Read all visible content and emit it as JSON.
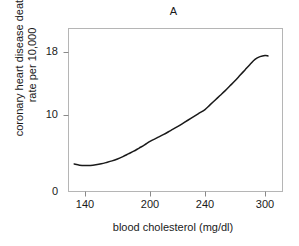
{
  "chart_data": {
    "type": "line",
    "title": "A",
    "xlabel": "blood cholesterol (mg/dl)",
    "ylabel_line1": "coronary heart disease death",
    "ylabel_line2": "rate per 10,000",
    "ylabel": "coronary heart disease death rate per 10,000",
    "xlim": [
      130,
      305
    ],
    "ylim": [
      0,
      20
    ],
    "xticks": [
      140,
      200,
      240,
      300
    ],
    "xtick_labels": [
      "140",
      "200",
      "240",
      "300"
    ],
    "yticks": [
      0,
      10,
      18
    ],
    "ytick_labels": [
      "0",
      "10",
      "18"
    ],
    "grid": false,
    "legend": "none",
    "line_color": "#1a1a1a",
    "frame_color": "#b5b5b5",
    "background": "#ffffff",
    "series": [
      {
        "name": "coronary heart disease death rate",
        "x": [
          130,
          135,
          140,
          145,
          150,
          155,
          160,
          165,
          170,
          175,
          180,
          185,
          190,
          195,
          200,
          205,
          210,
          215,
          220,
          225,
          230,
          235,
          240,
          245,
          250,
          255,
          260,
          265,
          270,
          275,
          280,
          285,
          290,
          295,
          300,
          303
        ],
        "y": [
          3.6,
          3.45,
          3.4,
          3.42,
          3.5,
          3.62,
          3.8,
          4.0,
          4.25,
          4.55,
          4.9,
          5.25,
          5.65,
          6.05,
          6.5,
          6.95,
          7.4,
          7.9,
          8.4,
          8.95,
          9.5,
          10.05,
          10.6,
          11.2,
          11.8,
          12.4,
          13.0,
          13.65,
          14.3,
          15.0,
          15.7,
          16.4,
          17.05,
          17.4,
          17.55,
          17.5
        ]
      }
    ]
  },
  "axes": {
    "ytick_positions_px": [
      192,
      115,
      52
    ],
    "xtick_positions_px": [
      85,
      150,
      205,
      265
    ],
    "frame": {
      "left": 68,
      "right": 283,
      "top": 28,
      "bottom": 192
    }
  }
}
